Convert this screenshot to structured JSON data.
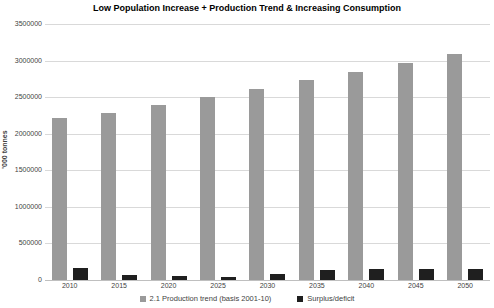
{
  "chart_data": {
    "type": "bar",
    "title": "Low Population Increase + Production Trend & Increasing Consumption",
    "ylabel": "'000 tonnes",
    "xlabel": "",
    "ylim": [
      0,
      3500000
    ],
    "ytick_interval": 500000,
    "ytick_labels": [
      "3500000",
      "3000000",
      "2500000",
      "2000000",
      "1500000",
      "1000000",
      "500000",
      "0"
    ],
    "categories": [
      "2010",
      "2015",
      "2020",
      "2025",
      "2030",
      "2035",
      "2040",
      "2045",
      "2050"
    ],
    "series": [
      {
        "name": "2.1 Production trend (basis 2001-10)",
        "color": "#9a9a9a",
        "values": [
          2210000,
          2290000,
          2390000,
          2500000,
          2610000,
          2730000,
          2845000,
          2960000,
          3090000
        ]
      },
      {
        "name": "Surplus/deficit",
        "color": "#1f1f1f",
        "values": [
          165000,
          75000,
          55000,
          35000,
          80000,
          135000,
          150000,
          150000,
          155000
        ]
      }
    ],
    "grid": true,
    "legend_position": "bottom"
  },
  "colors": {
    "background": "#ffffff",
    "gridline": "#d9d9d9",
    "axis_line": "#bfbfbf",
    "axis_text": "#3f3f3f",
    "title_text": "#000000"
  }
}
